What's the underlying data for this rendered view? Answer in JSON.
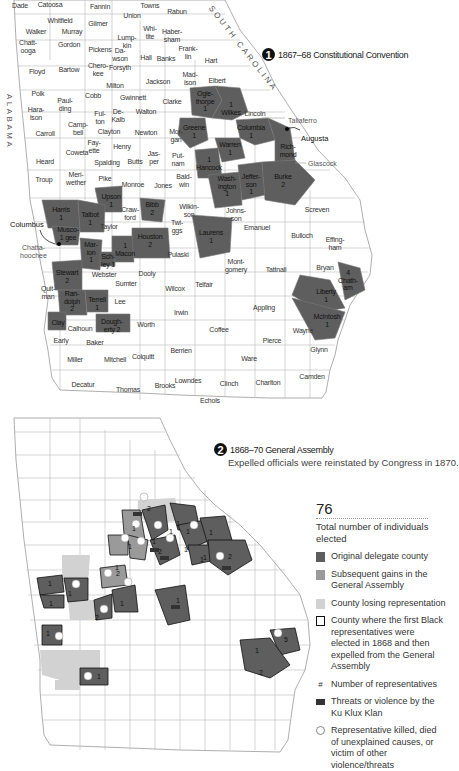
{
  "map1": {
    "badge": "1",
    "title": "1867–68 Constitutional Convention",
    "state_labels": {
      "south_carolina": "SOUTH CAROLINA",
      "alabama": "ALABAMA"
    },
    "cities": {
      "augusta": "Augusta",
      "columbus": "Columbus"
    },
    "callouts": {
      "taliaferro": "Taliaferro",
      "glascock": "Glascock",
      "chattahoochee": "Chatta-\nhoochee"
    },
    "counties": [
      {
        "name": "Dade",
        "x": 20,
        "y": 6,
        "shaded": false
      },
      {
        "name": "Catoosa",
        "x": 50,
        "y": 5,
        "shaded": false
      },
      {
        "name": "Fannin",
        "x": 100,
        "y": 7,
        "shaded": false
      },
      {
        "name": "Towns",
        "x": 150,
        "y": 6,
        "shaded": false
      },
      {
        "name": "Union",
        "x": 132,
        "y": 16,
        "shaded": false
      },
      {
        "name": "Rabun",
        "x": 177,
        "y": 12,
        "shaded": false
      },
      {
        "name": "Whitfield",
        "x": 60,
        "y": 21,
        "shaded": false
      },
      {
        "name": "Gilmer",
        "x": 98,
        "y": 24,
        "shaded": false
      },
      {
        "name": "Walker",
        "x": 36,
        "y": 32,
        "shaded": false
      },
      {
        "name": "Murray",
        "x": 72,
        "y": 32,
        "shaded": false
      },
      {
        "name": "Whi-\ntite",
        "x": 150,
        "y": 32,
        "shaded": false
      },
      {
        "name": "Haber-\nsham",
        "x": 172,
        "y": 35,
        "shaded": false
      },
      {
        "name": "Lump-\nkin",
        "x": 127,
        "y": 41,
        "shaded": false
      },
      {
        "name": "Chatt-\nooga",
        "x": 28,
        "y": 46,
        "shaded": false
      },
      {
        "name": "Gordon",
        "x": 69,
        "y": 45,
        "shaded": false
      },
      {
        "name": "Pickens",
        "x": 100,
        "y": 50,
        "shaded": false
      },
      {
        "name": "Frank-\nlin",
        "x": 188,
        "y": 52,
        "shaded": false
      },
      {
        "name": "Da-\nwson",
        "x": 120,
        "y": 54,
        "shaded": false
      },
      {
        "name": "Hall",
        "x": 146,
        "y": 58,
        "shaded": false
      },
      {
        "name": "Banks",
        "x": 166,
        "y": 59,
        "shaded": false
      },
      {
        "name": "Hart",
        "x": 211,
        "y": 61,
        "shaded": false
      },
      {
        "name": "Chero-\nkee",
        "x": 98,
        "y": 69,
        "shaded": false
      },
      {
        "name": "Floyd",
        "x": 37,
        "y": 72,
        "shaded": false
      },
      {
        "name": "Bartow",
        "x": 69,
        "y": 70,
        "shaded": false
      },
      {
        "name": "Forsyth",
        "x": 120,
        "y": 68,
        "shaded": false
      },
      {
        "name": "Jackson",
        "x": 158,
        "y": 82,
        "shaded": false
      },
      {
        "name": "Mad-\nison",
        "x": 190,
        "y": 78,
        "shaded": false
      },
      {
        "name": "Elbert",
        "x": 217,
        "y": 81,
        "shaded": false
      },
      {
        "name": "Milton",
        "x": 115,
        "y": 86,
        "shaded": false
      },
      {
        "name": "Polk",
        "x": 38,
        "y": 94,
        "shaded": false
      },
      {
        "name": "Paul-\nding",
        "x": 65,
        "y": 104,
        "shaded": false
      },
      {
        "name": "Cobb",
        "x": 93,
        "y": 96,
        "shaded": false
      },
      {
        "name": "Gwinnett",
        "x": 133,
        "y": 98,
        "shaded": false
      },
      {
        "name": "Clarke",
        "x": 172,
        "y": 102,
        "shaded": false
      },
      {
        "name": "Ogle-\nthorpe\n1",
        "x": 205,
        "y": 101,
        "shaded": true
      },
      {
        "name": "1\nWilkes",
        "x": 231,
        "y": 108,
        "shaded": true
      },
      {
        "name": "Hara-\nlson",
        "x": 36,
        "y": 113,
        "shaded": false
      },
      {
        "name": "Ful-\nton",
        "x": 100,
        "y": 117,
        "shaded": false
      },
      {
        "name": "De-\nKalb",
        "x": 118,
        "y": 115,
        "shaded": false
      },
      {
        "name": "Walton",
        "x": 146,
        "y": 112,
        "shaded": false
      },
      {
        "name": "Lincoln",
        "x": 255,
        "y": 114,
        "shaded": false
      },
      {
        "name": "Carroll",
        "x": 45,
        "y": 134,
        "shaded": false
      },
      {
        "name": "Camp-\nbell",
        "x": 78,
        "y": 128,
        "shaded": false
      },
      {
        "name": "Clayton",
        "x": 109,
        "y": 132,
        "shaded": false
      },
      {
        "name": "Newton",
        "x": 146,
        "y": 133,
        "shaded": false
      },
      {
        "name": "Mor-\ngan",
        "x": 176,
        "y": 135,
        "shaded": false
      },
      {
        "name": "Greene\n1",
        "x": 194,
        "y": 131,
        "shaded": true
      },
      {
        "name": "Fay-\nette",
        "x": 94,
        "y": 146,
        "shaded": false
      },
      {
        "name": "Henry",
        "x": 122,
        "y": 147,
        "shaded": false
      },
      {
        "name": "Columbia\n1",
        "x": 251,
        "y": 131,
        "shaded": true
      },
      {
        "name": "Warren\n1",
        "x": 230,
        "y": 148,
        "shaded": true
      },
      {
        "name": "Rich-\nmond",
        "x": 288,
        "y": 150,
        "shaded": true
      },
      {
        "name": "Heard",
        "x": 45,
        "y": 162,
        "shaded": false
      },
      {
        "name": "Coweta",
        "x": 77,
        "y": 153,
        "shaded": false
      },
      {
        "name": "Jas-\nper",
        "x": 154,
        "y": 157,
        "shaded": false
      },
      {
        "name": "Put-\nnam",
        "x": 178,
        "y": 159,
        "shaded": false
      },
      {
        "name": "1\nHancock",
        "x": 209,
        "y": 163,
        "shaded": true
      },
      {
        "name": "Spalding",
        "x": 107,
        "y": 163,
        "shaded": false
      },
      {
        "name": "Butts",
        "x": 135,
        "y": 162,
        "shaded": false
      },
      {
        "name": "Jeffer-\nson\n1",
        "x": 251,
        "y": 184,
        "shaded": true
      },
      {
        "name": "Burke\n2",
        "x": 283,
        "y": 180,
        "shaded": true
      },
      {
        "name": "Wash-\nington\n1",
        "x": 227,
        "y": 186,
        "shaded": true
      },
      {
        "name": "Troup",
        "x": 44,
        "y": 180,
        "shaded": false
      },
      {
        "name": "Meri-\nwether",
        "x": 76,
        "y": 178,
        "shaded": false
      },
      {
        "name": "Pike",
        "x": 105,
        "y": 179,
        "shaded": false
      },
      {
        "name": "Monroe",
        "x": 133,
        "y": 185,
        "shaded": false
      },
      {
        "name": "Jones",
        "x": 163,
        "y": 186,
        "shaded": false
      },
      {
        "name": "Bald-\nwin",
        "x": 184,
        "y": 180,
        "shaded": false
      },
      {
        "name": "Upson\n1",
        "x": 111,
        "y": 200,
        "shaded": true
      },
      {
        "name": "Harris\n1",
        "x": 61,
        "y": 213,
        "shaded": true
      },
      {
        "name": "Talbot\n1",
        "x": 90,
        "y": 218,
        "shaded": true
      },
      {
        "name": "Craw-\nford",
        "x": 130,
        "y": 213,
        "shaded": false
      },
      {
        "name": "Bibb\n2",
        "x": 152,
        "y": 208,
        "shaded": true
      },
      {
        "name": "Wilkin-\nson",
        "x": 189,
        "y": 210,
        "shaded": false
      },
      {
        "name": "Twi-\nggs",
        "x": 177,
        "y": 226,
        "shaded": false
      },
      {
        "name": "Johns-\nson",
        "x": 236,
        "y": 214,
        "shaded": false
      },
      {
        "name": "Screven",
        "x": 317,
        "y": 210,
        "shaded": false
      },
      {
        "name": "Musco-\n1 gee",
        "x": 68,
        "y": 233,
        "shaded": true
      },
      {
        "name": "Taylor",
        "x": 109,
        "y": 227,
        "shaded": false
      },
      {
        "name": "Houston\n2",
        "x": 150,
        "y": 240,
        "shaded": true
      },
      {
        "name": "Laurens\n1",
        "x": 211,
        "y": 236,
        "shaded": true
      },
      {
        "name": "Emanuel",
        "x": 257,
        "y": 228,
        "shaded": false
      },
      {
        "name": "Bulloch",
        "x": 302,
        "y": 236,
        "shaded": false
      },
      {
        "name": "Effing-\nham",
        "x": 335,
        "y": 243,
        "shaded": false
      },
      {
        "name": "Mar-\nion\n1",
        "x": 91,
        "y": 252,
        "shaded": true
      },
      {
        "name": "1\nMacon",
        "x": 125,
        "y": 249,
        "shaded": true
      },
      {
        "name": "Sch-\nley 1",
        "x": 108,
        "y": 260,
        "shaded": true
      },
      {
        "name": "Pulaski",
        "x": 178,
        "y": 255,
        "shaded": false
      },
      {
        "name": "Mont-\ngomery",
        "x": 236,
        "y": 265,
        "shaded": false
      },
      {
        "name": "Tattnall",
        "x": 276,
        "y": 270,
        "shaded": false
      },
      {
        "name": "Bryan",
        "x": 325,
        "y": 268,
        "shaded": false
      },
      {
        "name": "4\nChath-\nam",
        "x": 348,
        "y": 280,
        "shaded": true
      },
      {
        "name": "Stewart\n2",
        "x": 67,
        "y": 276,
        "shaded": true
      },
      {
        "name": "Webster",
        "x": 104,
        "y": 275,
        "shaded": false
      },
      {
        "name": "Dooly",
        "x": 147,
        "y": 274,
        "shaded": false
      },
      {
        "name": "Sumter",
        "x": 126,
        "y": 284,
        "shaded": false
      },
      {
        "name": "Telfair",
        "x": 204,
        "y": 285,
        "shaded": false
      },
      {
        "name": "Wilcox",
        "x": 175,
        "y": 289,
        "shaded": false
      },
      {
        "name": "Liberty\n1",
        "x": 326,
        "y": 295,
        "shaded": true
      },
      {
        "name": "Quit-\nman",
        "x": 48,
        "y": 292,
        "shaded": false
      },
      {
        "name": "Ran-\ndolph\n2",
        "x": 72,
        "y": 301,
        "shaded": true
      },
      {
        "name": "Terrell\n1",
        "x": 97,
        "y": 303,
        "shaded": true
      },
      {
        "name": "Lee",
        "x": 120,
        "y": 302,
        "shaded": false
      },
      {
        "name": "Irwin",
        "x": 181,
        "y": 313,
        "shaded": false
      },
      {
        "name": "Appling",
        "x": 264,
        "y": 308,
        "shaded": false
      },
      {
        "name": "McIntosh\n1",
        "x": 327,
        "y": 320,
        "shaded": true
      },
      {
        "name": "Clay",
        "x": 58,
        "y": 323,
        "shaded": true
      },
      {
        "name": "Calhoun",
        "x": 80,
        "y": 329,
        "shaded": false
      },
      {
        "name": "Dough-\nerty 2",
        "x": 112,
        "y": 325,
        "shaded": true
      },
      {
        "name": "Worth",
        "x": 146,
        "y": 325,
        "shaded": false
      },
      {
        "name": "Coffee",
        "x": 219,
        "y": 330,
        "shaded": false
      },
      {
        "name": "Wayne",
        "x": 303,
        "y": 331,
        "shaded": false
      },
      {
        "name": "Early",
        "x": 61,
        "y": 341,
        "shaded": false
      },
      {
        "name": "Baker",
        "x": 95,
        "y": 343,
        "shaded": false
      },
      {
        "name": "Pierce",
        "x": 272,
        "y": 341,
        "shaded": false
      },
      {
        "name": "Berrien",
        "x": 181,
        "y": 351,
        "shaded": false
      },
      {
        "name": "Glynn",
        "x": 319,
        "y": 350,
        "shaded": false
      },
      {
        "name": "Miller",
        "x": 75,
        "y": 360,
        "shaded": false
      },
      {
        "name": "Mitchell",
        "x": 115,
        "y": 360,
        "shaded": false
      },
      {
        "name": "Colquitt",
        "x": 143,
        "y": 357,
        "shaded": false
      },
      {
        "name": "Ware",
        "x": 249,
        "y": 359,
        "shaded": false
      },
      {
        "name": "Decatur",
        "x": 83,
        "y": 385,
        "shaded": false
      },
      {
        "name": "Thomas",
        "x": 128,
        "y": 390,
        "shaded": false
      },
      {
        "name": "Brooks",
        "x": 165,
        "y": 386,
        "shaded": false
      },
      {
        "name": "Lowndes",
        "x": 188,
        "y": 381,
        "shaded": false
      },
      {
        "name": "Clinch",
        "x": 229,
        "y": 384,
        "shaded": false
      },
      {
        "name": "Echols",
        "x": 210,
        "y": 401,
        "shaded": false
      },
      {
        "name": "Charlton",
        "x": 268,
        "y": 383,
        "shaded": false
      },
      {
        "name": "Camden",
        "x": 312,
        "y": 377,
        "shaded": false
      }
    ]
  },
  "map2": {
    "badge": "2",
    "title": "1868–70 General Assembly",
    "subtitle": "Expelled officials were reinstated by Congress in 1870.",
    "numbers": [
      {
        "v": "2",
        "x": 149,
        "y": 508
      },
      {
        "v": "1",
        "x": 178,
        "y": 523
      },
      {
        "v": "1",
        "x": 134,
        "y": 528
      },
      {
        "v": "1",
        "x": 171,
        "y": 531
      },
      {
        "v": "1",
        "x": 188,
        "y": 531
      },
      {
        "v": "1",
        "x": 154,
        "y": 541
      },
      {
        "v": "1",
        "x": 130,
        "y": 546
      },
      {
        "v": "1",
        "x": 186,
        "y": 549
      },
      {
        "v": "1",
        "x": 211,
        "y": 532
      },
      {
        "v": "2",
        "x": 160,
        "y": 551
      },
      {
        "v": "1",
        "x": 205,
        "y": 557
      },
      {
        "v": "2",
        "x": 230,
        "y": 556
      },
      {
        "v": "1",
        "x": 202,
        "y": 559
      },
      {
        "v": "1",
        "x": 117,
        "y": 567
      },
      {
        "v": "2",
        "x": 118,
        "y": 573
      },
      {
        "v": "1",
        "x": 50,
        "y": 583
      },
      {
        "v": "1",
        "x": 70,
        "y": 593
      },
      {
        "v": "1",
        "x": 122,
        "y": 603
      },
      {
        "v": "1",
        "x": 51,
        "y": 603
      },
      {
        "v": "1",
        "x": 178,
        "y": 600
      },
      {
        "v": "2",
        "x": 97,
        "y": 617
      },
      {
        "v": "1",
        "x": 48,
        "y": 633
      },
      {
        "v": "5",
        "x": 286,
        "y": 639
      },
      {
        "v": "1",
        "x": 257,
        "y": 650
      },
      {
        "v": "2",
        "x": 261,
        "y": 672
      },
      {
        "v": "1",
        "x": 99,
        "y": 676
      }
    ]
  },
  "legend": {
    "total": "76",
    "total_caption": "Total number of individuals elected",
    "items": [
      {
        "label": "Original delegate county",
        "swatch": "#5e5e5e",
        "type": "fill"
      },
      {
        "label": "Subsequent gains in the General Assembly",
        "swatch": "#9a9a9a",
        "type": "fill"
      },
      {
        "label": "County losing representation",
        "swatch": "#d2d2d2",
        "type": "fill"
      },
      {
        "label": "County where the first Black representatives were elected in 1868 and then expelled from the General Assembly",
        "swatch": "#ffffff",
        "type": "outline"
      },
      {
        "label": "Number of representatives",
        "symbol": "#",
        "type": "symbol"
      },
      {
        "label": "Threats or violence by the Ku Klux Klan",
        "symbol": "KKK",
        "type": "kkk"
      },
      {
        "label": "Representative killed, died of unexplained causes, or victim of other violence/threats",
        "symbol": "star",
        "type": "star"
      }
    ]
  },
  "colors": {
    "original": "#5e5e5e",
    "gain": "#9a9a9a",
    "loss": "#d2d2d2",
    "border": "#999999",
    "outline": "#111111"
  }
}
